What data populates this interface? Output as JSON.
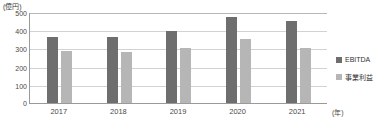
{
  "chart_data": {
    "type": "bar",
    "title": "",
    "subtitle": "",
    "xlabel": "(年)",
    "ylabel": "(億円)",
    "categories": [
      "2017",
      "2018",
      "2019",
      "2020",
      "2021"
    ],
    "series": [
      {
        "name": "EBITDA",
        "color": "#6e6e6e",
        "values": [
          360,
          365,
          395,
          475,
          450
        ]
      },
      {
        "name": "事業利益",
        "color": "#b6b6b6",
        "values": [
          285,
          280,
          300,
          350,
          305
        ]
      }
    ],
    "ylim": [
      0,
      500
    ],
    "yticks": [
      "0",
      "100",
      "200",
      "300",
      "400",
      "500"
    ],
    "ytick_values": [
      0,
      100,
      200,
      300,
      400,
      500
    ],
    "grid": true,
    "legend_position": "right"
  },
  "axis": {
    "unit_y": "(億円)",
    "unit_x": "(年)",
    "zero_label": "0"
  },
  "legend": {
    "items": [
      {
        "label": "EBITDA",
        "color": "#6e6e6e"
      },
      {
        "label": "事業利益",
        "color": "#b6b6b6"
      }
    ]
  },
  "colors": {
    "ebitda": "#6e6e6e",
    "profit": "#b6b6b6",
    "gridline": "#d2d2d2",
    "axis": "#9a9a9a",
    "background": "#ffffff",
    "text": "#4a4a4a"
  }
}
